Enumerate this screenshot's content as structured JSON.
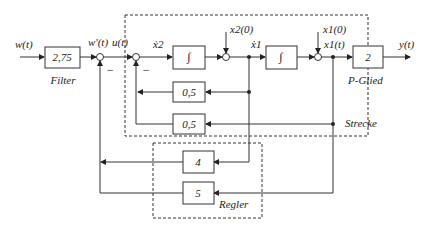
{
  "diagram": {
    "type": "control-block-diagram",
    "signals": {
      "input": "w(t)",
      "filtered": "w'(t)",
      "control": "u(t)",
      "x2dot": "ẋ2",
      "x1dot": "ẋ1",
      "x2_init": "x2(0)",
      "x1_init": "x1(0)",
      "x1": "x1(t)",
      "output": "y(t)"
    },
    "blocks": {
      "filter": {
        "gain": "2,75",
        "label": "Filter"
      },
      "integrator1": {
        "symbol": "∫"
      },
      "integrator2": {
        "symbol": "∫"
      },
      "p_glied": {
        "gain": "2",
        "label": "P-Glied"
      },
      "strecke_fb1": {
        "gain": "0,5"
      },
      "strecke_fb2": {
        "gain": "0,5"
      },
      "regler_k1": {
        "gain": "4"
      },
      "regler_k2": {
        "gain": "5"
      }
    },
    "groups": {
      "strecke": "Strecke",
      "regler": "Regler"
    },
    "signs": {
      "sum1_minus": "−",
      "sum2_minus": "−"
    }
  }
}
